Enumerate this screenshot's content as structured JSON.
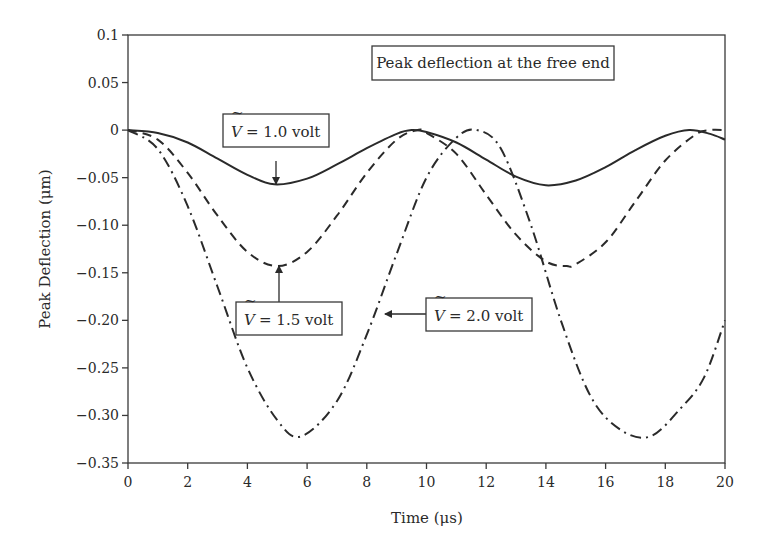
{
  "chart_data": {
    "type": "line",
    "title": "Peak deflection at the free end",
    "xlabel": "Time (μs)",
    "ylabel": "Peak Deflection (μm)",
    "xlim": [
      0,
      20
    ],
    "ylim": [
      -0.35,
      0.1
    ],
    "xticks": [
      0,
      2,
      4,
      6,
      8,
      10,
      12,
      14,
      16,
      18,
      20
    ],
    "xtick_labels": [
      "0",
      "2",
      "4",
      "6",
      "8",
      "10",
      "12",
      "14",
      "16",
      "18",
      "20"
    ],
    "yticks": [
      0.1,
      0.05,
      0,
      -0.05,
      -0.1,
      -0.15,
      -0.2,
      -0.25,
      -0.3,
      -0.35
    ],
    "ytick_labels": [
      "0.1",
      "0.05",
      "0",
      "−0.05",
      "−0.10",
      "−0.15",
      "−0.20",
      "−0.25",
      "−0.30",
      "−0.35"
    ],
    "grid": false,
    "legend": "annotations",
    "series": [
      {
        "name": "V = 1.0 volt",
        "style": "solid",
        "color": "#2a2a2a",
        "x": [
          0,
          1,
          2,
          3,
          4,
          4.9,
          6,
          7,
          8,
          9,
          9.5,
          10,
          11,
          12,
          13,
          14,
          15,
          16,
          17,
          18,
          18.8,
          19.5,
          20
        ],
        "y": [
          0,
          -0.003,
          -0.013,
          -0.03,
          -0.047,
          -0.057,
          -0.051,
          -0.036,
          -0.019,
          -0.004,
          0,
          -0.002,
          -0.013,
          -0.031,
          -0.049,
          -0.058,
          -0.053,
          -0.039,
          -0.021,
          -0.006,
          0,
          -0.004,
          -0.01
        ]
      },
      {
        "name": "V = 1.5 volt",
        "style": "dashed",
        "color": "#2a2a2a",
        "x": [
          0,
          1,
          2,
          3,
          4,
          5,
          6,
          7,
          8,
          9,
          9.7,
          10,
          11,
          12,
          13,
          14,
          14.7,
          15,
          16,
          17,
          18,
          19,
          19.5,
          20
        ],
        "y": [
          0,
          -0.01,
          -0.045,
          -0.09,
          -0.128,
          -0.143,
          -0.128,
          -0.09,
          -0.045,
          -0.01,
          0,
          -0.003,
          -0.025,
          -0.068,
          -0.11,
          -0.138,
          -0.143,
          -0.141,
          -0.118,
          -0.075,
          -0.032,
          -0.005,
          0,
          0
        ]
      },
      {
        "name": "V = 2.0 volt",
        "style": "dash-dot",
        "color": "#2a2a2a",
        "x": [
          0,
          1,
          2,
          3,
          4,
          5,
          5.8,
          7,
          8,
          9,
          10,
          11,
          11.7,
          12.5,
          13.5,
          14.5,
          15.5,
          16.5,
          17.5,
          18.5,
          19.3,
          20
        ],
        "y": [
          0,
          -0.02,
          -0.08,
          -0.165,
          -0.25,
          -0.305,
          -0.322,
          -0.285,
          -0.215,
          -0.13,
          -0.05,
          -0.008,
          0,
          -0.02,
          -0.1,
          -0.2,
          -0.28,
          -0.315,
          -0.322,
          -0.293,
          -0.26,
          -0.2
        ]
      }
    ],
    "annotations": [
      {
        "text": "Peak deflection at the free end",
        "type": "title-box"
      },
      {
        "prefix": "V",
        "text": "= 1.0 volt",
        "points_to": [
          4.9,
          -0.057
        ]
      },
      {
        "prefix": "V",
        "text": "= 1.5 volt",
        "points_to": [
          5.0,
          -0.143
        ]
      },
      {
        "prefix": "V",
        "text": "= 2.0 volt",
        "points_to": [
          8.4,
          -0.19
        ]
      }
    ]
  },
  "labels": {
    "title_box": "Peak deflection at the free end",
    "xlabel": "Time (μs)",
    "ylabel": "Peak Deflection (μm)",
    "v_symbol": "V",
    "v_tilde": "~",
    "ann_1": "= 1.0 volt",
    "ann_2": "= 1.5 volt",
    "ann_3": "= 2.0 volt"
  }
}
